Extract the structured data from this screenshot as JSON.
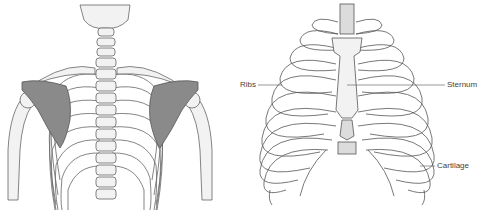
{
  "figures": [
    {
      "id": "posterior-view",
      "description": "Posterior view of upper skeleton: skull base, cervical/thoracic spine, ribs, clavicles, shaded scapulae, upper arms",
      "highlight_color": "#8a8a8a"
    },
    {
      "id": "anterior-ribcage",
      "description": "Anterior view of rib cage with sternum and costal cartilage",
      "labels": {
        "ribs": "Ribs",
        "sternum": "Sternum",
        "cartilage": "Cartilage"
      }
    }
  ],
  "colors": {
    "bone_fill": "#f2f2f2",
    "bone_stroke": "#555555",
    "cartilage_fill": "#dcdcdc",
    "scapula_fill": "#8a8a8a",
    "label_text": "#444444"
  }
}
